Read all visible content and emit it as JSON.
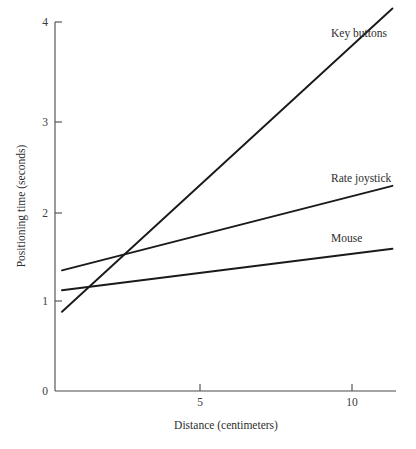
{
  "chart_data": {
    "type": "line",
    "title": "",
    "xlabel": "Distance (centimeters)",
    "ylabel": "Positioning time (seconds)",
    "xlim": [
      0,
      11.7
    ],
    "ylim": [
      0,
      4.1
    ],
    "xticks": [
      5,
      10
    ],
    "xtick_labels": [
      "5",
      "10"
    ],
    "yticks": [
      0,
      1,
      2,
      3,
      4
    ],
    "ytick_labels": [
      "0",
      "1",
      "2",
      "3",
      "4"
    ],
    "grid": false,
    "legend_position": "inline-right",
    "series": [
      {
        "name": "Key buttons",
        "label": "Key buttons",
        "x": [
          0.23,
          11.1
        ],
        "values": [
          0.88,
          4.25
        ]
      },
      {
        "name": "Rate joystick",
        "label": "Rate joystick",
        "x": [
          0.23,
          11.1
        ],
        "values": [
          1.34,
          2.28
        ]
      },
      {
        "name": "Mouse",
        "label": "Mouse",
        "x": [
          0.23,
          11.1
        ],
        "values": [
          1.12,
          1.58
        ]
      }
    ]
  },
  "geometry": {
    "origin_x": 55,
    "origin_y": 391,
    "x_unit_px": 30.4,
    "y_unit_px": 90.0,
    "x_axis_end": 396,
    "y_axis_top": 22
  },
  "colors": {
    "background": "#ffffff",
    "axis": "#4a4a4a",
    "line": "#1a1a1a",
    "text": "#2e2e2e"
  },
  "labels": {
    "x_axis_title": "Distance (centimeters)",
    "y_axis_title": "Positioning time (seconds)",
    "series_key_buttons": "Key buttons",
    "series_rate_joystick": "Rate joystick",
    "series_mouse": "Mouse",
    "ytick_0": "0",
    "ytick_1": "1",
    "ytick_2": "2",
    "ytick_3": "3",
    "ytick_4": "4",
    "xtick_5": "5",
    "xtick_10": "10"
  }
}
